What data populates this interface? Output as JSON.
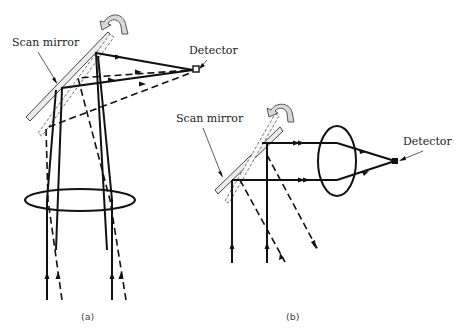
{
  "figure": {
    "panels": [
      {
        "id": "a",
        "caption": "(a)",
        "labels": {
          "mirror": "Scan mirror",
          "detector": "Detector"
        },
        "components": [
          "scan-mirror (rotating, two positions)",
          "lens",
          "detector"
        ]
      },
      {
        "id": "b",
        "caption": "(b)",
        "labels": {
          "mirror": "Scan mirror",
          "detector": "Detector"
        },
        "components": [
          "scan-mirror (rotating, two positions)",
          "lens",
          "detector"
        ]
      }
    ],
    "colors": {
      "line": "#111111",
      "mirror_fill": "#ececec",
      "background": "#ffffff"
    }
  }
}
